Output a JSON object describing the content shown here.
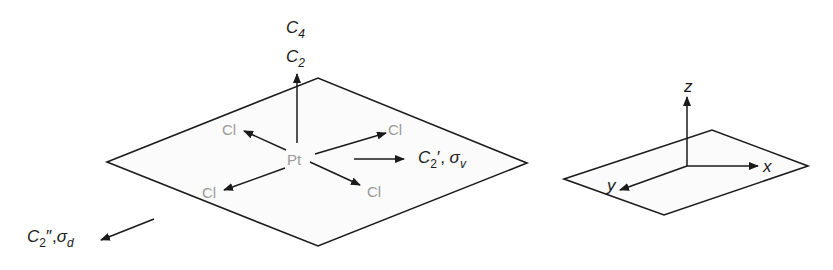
{
  "diagram": {
    "molecule": {
      "center_atom": "Pt",
      "ligands": [
        "Cl",
        "Cl",
        "Cl",
        "Cl"
      ]
    },
    "symmetry_labels": {
      "c4": {
        "main": "C",
        "sub": "4"
      },
      "c2": {
        "main": "C",
        "sub": "2"
      },
      "c2_prime": {
        "main": "C",
        "sub": "2",
        "suffix": "′, ",
        "sigma": "σ",
        "sigma_sub": "v"
      },
      "c2_dprime": {
        "main": "C",
        "sub": "2",
        "suffix": "″,",
        "sigma": "σ",
        "sigma_sub": "d"
      }
    },
    "axes": {
      "x": "x",
      "y": "y",
      "z": "z"
    },
    "colors": {
      "line": "#1a1a1a",
      "atom_text": "#9a9a9a",
      "plane_fill": "#fbfbfb"
    }
  }
}
